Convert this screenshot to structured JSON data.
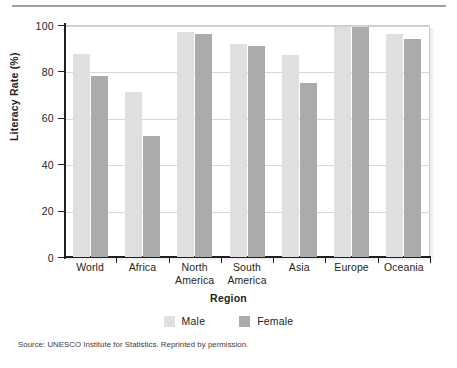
{
  "figure": {
    "source_note": "Source: UNESCO Institute for Statistics. Reprinted by permission."
  },
  "chart_data": {
    "type": "bar",
    "title": "",
    "xlabel": "Region",
    "ylabel": "Literacy Rate (%)",
    "categories": [
      "World",
      "Africa",
      "North America",
      "South America",
      "Asia",
      "Europe",
      "Oceania"
    ],
    "category_lines": [
      "World",
      "Africa",
      "North\nAmerica",
      "South\nAmerica",
      "Asia",
      "Europe",
      "Oceania"
    ],
    "series": [
      {
        "name": "Male",
        "color": "#dedfe0",
        "values": [
          87.5,
          71,
          97,
          92,
          87,
          99,
          96
        ]
      },
      {
        "name": "Female",
        "color": "#a9abad",
        "values": [
          78,
          52,
          96,
          91,
          75,
          99,
          94
        ]
      }
    ],
    "ylim": [
      0,
      100
    ],
    "yticks": [
      0,
      20,
      40,
      60,
      80,
      100
    ],
    "ytick_labels": [
      "0",
      "20",
      "40",
      "60",
      "80",
      "100"
    ],
    "grid": "horizontal",
    "legend_position": "bottom-center"
  }
}
